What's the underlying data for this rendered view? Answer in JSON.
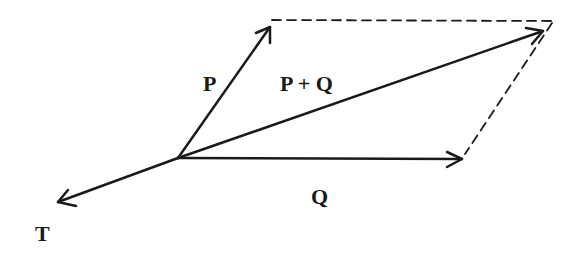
{
  "diagram": {
    "type": "vector-parallelogram",
    "labels": {
      "p": "P",
      "sum": "P + Q",
      "q": "Q",
      "t": "T"
    },
    "colors": {
      "stroke": "#1a1a1a",
      "background": "#ffffff"
    }
  }
}
